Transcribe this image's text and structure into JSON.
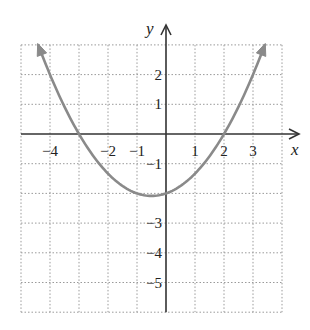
{
  "chart_data": {
    "type": "line",
    "title": "",
    "xlabel": "x",
    "ylabel": "y",
    "xlim": [
      -5,
      4
    ],
    "ylim": [
      -6,
      3
    ],
    "grid": true,
    "grid_style": "dotted",
    "x_ticks": [
      -4,
      -2,
      -1,
      1,
      2,
      3
    ],
    "x_tick_labels": [
      "−4",
      "−2",
      "−1",
      "1",
      "2",
      "3"
    ],
    "y_ticks": [
      2,
      1,
      -1,
      -3,
      -4,
      -5
    ],
    "y_tick_labels": [
      "2",
      "1",
      "−1",
      "−3",
      "−4",
      "−5"
    ],
    "series": [
      {
        "name": "parabola",
        "function": "y = (1/3)(x+3)(x-2)",
        "x_range": [
          -4.4,
          3.4
        ],
        "roots": [
          -3,
          2
        ],
        "y_intercept": -2,
        "vertex": [
          -0.5,
          -2.08
        ],
        "arrows_at_ends": true,
        "color": "#8a8a8a"
      }
    ]
  },
  "colors": {
    "curve": "#8a8a8a",
    "axis": "#333333",
    "grid": "#9a9a9a"
  }
}
